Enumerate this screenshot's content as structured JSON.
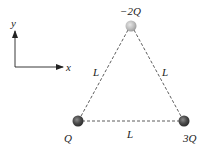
{
  "diagram": {
    "type": "charge-triangle",
    "axes": {
      "x_label": "x",
      "y_label": "y"
    },
    "charges": [
      {
        "id": "top",
        "label": "−2Q",
        "value": "-2Q",
        "position": "apex",
        "color": "#b5b5b5"
      },
      {
        "id": "bottom-left",
        "label": "Q",
        "value": "Q",
        "position": "bottom-left",
        "color": "#555555"
      },
      {
        "id": "bottom-right",
        "label": "3Q",
        "value": "3Q",
        "position": "bottom-right",
        "color": "#555555"
      }
    ],
    "sides": {
      "left": "L",
      "right": "L",
      "bottom": "L"
    },
    "colors": {
      "line": "#333333",
      "text": "#222222"
    }
  }
}
